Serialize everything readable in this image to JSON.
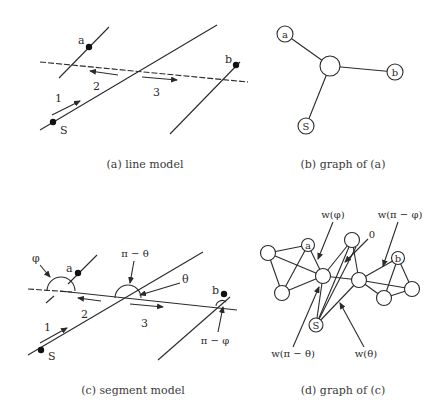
{
  "panels": {
    "a": {
      "caption": "(a) line model",
      "labels": {
        "a": "a",
        "b": "b",
        "s": "S",
        "seg1": "1",
        "seg2": "2",
        "seg3": "3"
      }
    },
    "b": {
      "caption": "(b) graph of (a)",
      "nodes": {
        "a": "a",
        "b": "b",
        "s": "S",
        "center": ""
      }
    },
    "c": {
      "caption": "(c) segment model",
      "labels": {
        "a": "a",
        "b": "b",
        "s": "S",
        "seg1": "1",
        "seg2": "2",
        "seg3": "3",
        "phi": "φ",
        "pi_minus_theta": "π − θ",
        "theta": "θ",
        "pi_minus_phi": "π − φ"
      }
    },
    "d": {
      "caption": "(d) graph of (c)",
      "nodes": {
        "a": "a",
        "b": "b",
        "s": "S"
      },
      "weights": {
        "w_phi": "w(φ)",
        "w_pi_minus_phi": "w(π − φ)",
        "zero": "0",
        "w_pi_minus_theta": "w(π − θ)",
        "w_theta": "w(θ)"
      }
    }
  },
  "colors": {
    "ink": "#2a2a2a",
    "background": "#ffffff"
  }
}
